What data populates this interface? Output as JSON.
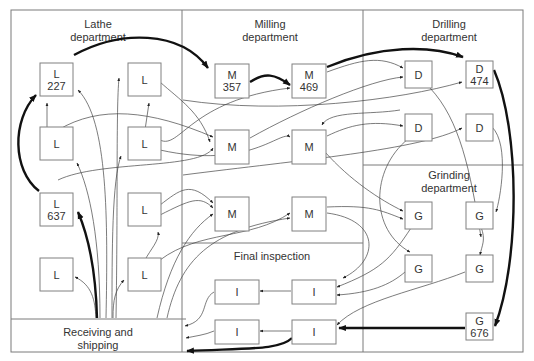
{
  "diagram": {
    "departments": [
      {
        "id": "lathe",
        "label_lines": [
          "Lathe",
          "department"
        ]
      },
      {
        "id": "milling",
        "label_lines": [
          "Milling",
          "department"
        ]
      },
      {
        "id": "drilling",
        "label_lines": [
          "Drilling",
          "department"
        ]
      },
      {
        "id": "grinding",
        "label_lines": [
          "Grinding",
          "department"
        ]
      },
      {
        "id": "inspection",
        "label_lines": [
          "Final inspection"
        ]
      },
      {
        "id": "receiving",
        "label_lines": [
          "Receiving and",
          "shipping"
        ]
      }
    ],
    "machines": [
      {
        "id": "L227",
        "type": "L",
        "number": "227",
        "dept": "lathe"
      },
      {
        "id": "L2",
        "type": "L",
        "number": "",
        "dept": "lathe"
      },
      {
        "id": "L3",
        "type": "L",
        "number": "",
        "dept": "lathe"
      },
      {
        "id": "L4",
        "type": "L",
        "number": "",
        "dept": "lathe"
      },
      {
        "id": "L637",
        "type": "L",
        "number": "637",
        "dept": "lathe"
      },
      {
        "id": "L6",
        "type": "L",
        "number": "",
        "dept": "lathe"
      },
      {
        "id": "L7",
        "type": "L",
        "number": "",
        "dept": "lathe"
      },
      {
        "id": "L8",
        "type": "L",
        "number": "",
        "dept": "lathe"
      },
      {
        "id": "M357",
        "type": "M",
        "number": "357",
        "dept": "milling"
      },
      {
        "id": "M469",
        "type": "M",
        "number": "469",
        "dept": "milling"
      },
      {
        "id": "M3",
        "type": "M",
        "number": "",
        "dept": "milling"
      },
      {
        "id": "M4",
        "type": "M",
        "number": "",
        "dept": "milling"
      },
      {
        "id": "M5",
        "type": "M",
        "number": "",
        "dept": "milling"
      },
      {
        "id": "M6",
        "type": "M",
        "number": "",
        "dept": "milling"
      },
      {
        "id": "D1",
        "type": "D",
        "number": "",
        "dept": "drilling"
      },
      {
        "id": "D474",
        "type": "D",
        "number": "474",
        "dept": "drilling"
      },
      {
        "id": "D3",
        "type": "D",
        "number": "",
        "dept": "drilling"
      },
      {
        "id": "D4",
        "type": "D",
        "number": "",
        "dept": "drilling"
      },
      {
        "id": "G1",
        "type": "G",
        "number": "",
        "dept": "grinding"
      },
      {
        "id": "G2",
        "type": "G",
        "number": "",
        "dept": "grinding"
      },
      {
        "id": "G3",
        "type": "G",
        "number": "",
        "dept": "grinding"
      },
      {
        "id": "G4",
        "type": "G",
        "number": "",
        "dept": "grinding"
      },
      {
        "id": "G676",
        "type": "G",
        "number": "676",
        "dept": "grinding"
      },
      {
        "id": "I1",
        "type": "I",
        "number": "",
        "dept": "inspection"
      },
      {
        "id": "I2",
        "type": "I",
        "number": "",
        "dept": "inspection"
      },
      {
        "id": "I3",
        "type": "I",
        "number": "",
        "dept": "inspection"
      },
      {
        "id": "I4",
        "type": "I",
        "number": "",
        "dept": "inspection"
      }
    ],
    "highlighted_route": [
      "Receiving",
      "L637",
      "L227",
      "M357",
      "M469",
      "D474",
      "G676",
      "I4",
      "Shipping"
    ]
  }
}
